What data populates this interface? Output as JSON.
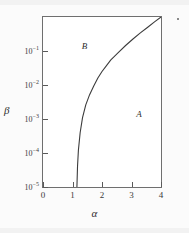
{
  "chart_data": {
    "type": "line",
    "title": "",
    "xlabel": "α",
    "ylabel": "β",
    "xlim": [
      0,
      4
    ],
    "ylim": [
      1e-05,
      1
    ],
    "yscale": "log",
    "xscale": "linear",
    "grid": false,
    "legend": null,
    "xticks": [
      {
        "value": 0,
        "label": "0"
      },
      {
        "value": 1,
        "label": "1"
      },
      {
        "value": 2,
        "label": "2"
      },
      {
        "value": 3,
        "label": "3"
      },
      {
        "value": 4,
        "label": "4"
      }
    ],
    "yticks": [
      {
        "value": 0.1,
        "mantissa": "10",
        "exponent": "−1"
      },
      {
        "value": 0.01,
        "mantissa": "10",
        "exponent": "−2"
      },
      {
        "value": 0.001,
        "mantissa": "10",
        "exponent": "−3"
      },
      {
        "value": 0.0001,
        "mantissa": "10",
        "exponent": "−4"
      },
      {
        "value": 1e-05,
        "mantissa": "10",
        "exponent": "−5"
      }
    ],
    "series": [
      {
        "name": "phase-boundary",
        "color": "#3c3c3c",
        "points": [
          {
            "x": 1.15,
            "y": 1e-05
          },
          {
            "x": 1.17,
            "y": 4e-05
          },
          {
            "x": 1.2,
            "y": 0.00012
          },
          {
            "x": 1.26,
            "y": 0.0004
          },
          {
            "x": 1.34,
            "y": 0.0011
          },
          {
            "x": 1.45,
            "y": 0.0026
          },
          {
            "x": 1.58,
            "y": 0.0052
          },
          {
            "x": 1.72,
            "y": 0.0093
          },
          {
            "x": 1.86,
            "y": 0.016
          },
          {
            "x": 2.0,
            "y": 0.025
          },
          {
            "x": 2.12,
            "y": 0.034
          },
          {
            "x": 2.3,
            "y": 0.055
          },
          {
            "x": 2.55,
            "y": 0.09
          },
          {
            "x": 2.8,
            "y": 0.145
          },
          {
            "x": 3.05,
            "y": 0.225
          },
          {
            "x": 3.3,
            "y": 0.34
          },
          {
            "x": 3.55,
            "y": 0.5
          },
          {
            "x": 3.78,
            "y": 0.72
          },
          {
            "x": 4.0,
            "y": 1.0
          }
        ]
      }
    ],
    "annotations": [
      {
        "name": "region-b",
        "text": "B",
        "x": 1.45,
        "y": 0.13
      },
      {
        "name": "region-a",
        "text": "A",
        "x": 3.3,
        "y": 0.0013
      }
    ]
  }
}
